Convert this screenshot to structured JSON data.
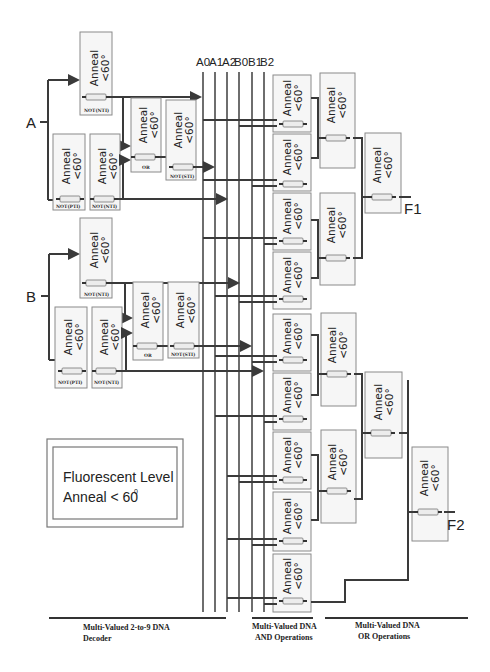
{
  "bus": {
    "labels": [
      "A0",
      "A1",
      "A2",
      "B0",
      "B1",
      "B2"
    ]
  },
  "inputs": {
    "a": "A",
    "b": "B"
  },
  "outputs": {
    "f1": "F1",
    "f2": "F2"
  },
  "gate": {
    "line1": "Anneal",
    "line2": "<60°"
  },
  "tags": {
    "not_pti": "NOT(PTI)",
    "not_nti": "NOT(NTI)",
    "not_sti": "NOT(STI)",
    "or": "OR"
  },
  "legend": {
    "line1": "Fluorescent Level",
    "line2": "Anneal < 60",
    "sup": "0"
  },
  "sections": {
    "decoder": {
      "line1": "Multi-Valued 2-to-9 DNA",
      "line2": "Decoder"
    },
    "and_ops": {
      "line1": "Multi-Valued DNA",
      "line2": "AND Operations"
    },
    "or_ops": {
      "line1": "Multi-Valued DNA",
      "line2": "OR Operations"
    }
  },
  "and_subscripts": [
    "1",
    "2",
    "3",
    "4",
    "5",
    "6",
    "7",
    "8",
    "9"
  ]
}
